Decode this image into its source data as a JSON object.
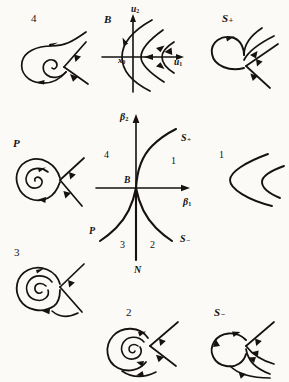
{
  "figure": {
    "kind": "bogdanov-takens-bifurcation-diagram",
    "background_color": "#fbfaf7",
    "ink_color": "#15120f"
  },
  "central_diagram": {
    "name": "parameter-plane",
    "axes": {
      "x_label": "β1",
      "x_label_base": "β",
      "x_label_sub": "1",
      "y_label": "β2",
      "y_label_base": "β",
      "y_label_sub": "2"
    },
    "origin_label": "B",
    "curves": [
      {
        "name": "S-plus",
        "label_base": "S",
        "label_sup": "+",
        "label": "S₊",
        "position": "upper-right"
      },
      {
        "name": "S-minus",
        "label_base": "S",
        "label_sup": "−",
        "label": "S₋",
        "position": "lower-right"
      },
      {
        "name": "P",
        "label_base": "P",
        "label_sup": "",
        "label": "P",
        "position": "lower-left"
      },
      {
        "name": "N",
        "label_base": "N",
        "label_sup": "",
        "label": "N",
        "position": "bottom"
      }
    ],
    "regions": [
      {
        "name": "region-1",
        "label": "1",
        "position": "right"
      },
      {
        "name": "region-2",
        "label": "2",
        "position": "bottom-right"
      },
      {
        "name": "region-3",
        "label": "3",
        "position": "bottom-left"
      },
      {
        "name": "region-4",
        "label": "4",
        "position": "upper-left"
      }
    ]
  },
  "panels": [
    {
      "name": "panel-4",
      "label": "4",
      "label_base": "4",
      "label_sup": "",
      "position": "top-left",
      "description": "saddle with unstable focus and large outgoing spiral"
    },
    {
      "name": "panel-B",
      "label": "B",
      "label_base": "B",
      "label_sup": "",
      "position": "top-center",
      "description": "Bogdanov-Takens point: cusp of trajectories at degenerate equilibrium",
      "axes": {
        "x_label": "u1",
        "x_label_base": "u",
        "x_label_sub": "1",
        "y_label": "u2",
        "y_label_base": "u",
        "y_label_sub": "2"
      },
      "equilibrium_label": "x0",
      "equilibrium_label_base": "x",
      "equilibrium_label_sub": "0"
    },
    {
      "name": "panel-S-plus",
      "label": "S₊",
      "label_base": "S",
      "label_sup": "+",
      "position": "top-right",
      "description": "saddle homoclinic loop, outer orbits escaping"
    },
    {
      "name": "panel-P",
      "label": "P",
      "label_base": "P",
      "label_sup": "",
      "position": "middle-left",
      "description": "homoclinic loop enclosing a stable focus"
    },
    {
      "name": "panel-1",
      "label": "1",
      "label_base": "1",
      "label_sup": "",
      "position": "middle-right",
      "description": "no equilibria: two nested open parabolic arcs"
    },
    {
      "name": "panel-3",
      "label": "3",
      "label_base": "3",
      "label_sup": "",
      "position": "bottom-left",
      "description": "limit cycle around unstable focus with saddle"
    },
    {
      "name": "panel-2",
      "label": "2",
      "label_base": "2",
      "label_sup": "",
      "position": "bottom-center",
      "description": "saddle with stable focus, inward spiral"
    },
    {
      "name": "panel-S-minus",
      "label": "S₋",
      "label_base": "S",
      "label_sup": "−",
      "position": "bottom-right",
      "description": "saddle homoclinic loop with outgoing trajectories"
    }
  ]
}
